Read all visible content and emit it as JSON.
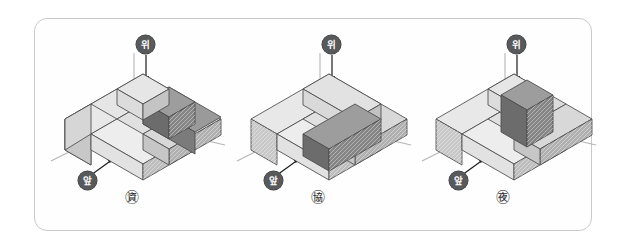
{
  "figure": {
    "kind": "geometry-diagram",
    "border_color": "#c9c9c9",
    "background": "#ffffff"
  },
  "labels": {
    "top_direction": "위",
    "front_direction": "앞",
    "badge_bg": "#58595b",
    "badge_fg": "#ffffff"
  },
  "colors": {
    "face_top_light": "#e3e3e3",
    "face_left_light": "#efefef",
    "face_right_light": "#cfcfcf",
    "face_top_mid": "#d2d2d2",
    "face_left_mid": "#c5c5c5",
    "face_right_mid": "#b4b4b4",
    "face_top_dark": "#8e8e8e",
    "face_left_dark": "#7f7f7f",
    "face_right_dark": "#6e6e6e",
    "edge": "#4a4a4a",
    "axis": "#b5b5b5"
  },
  "panels": [
    {
      "id": "panel-ga",
      "name": "㊮",
      "label": "㊮",
      "top_badge": "위",
      "front_badge": "앞",
      "dark_block": "back-right horizontal bar, 2 cubes running right-back, raised on second level"
    },
    {
      "id": "panel-na",
      "name": "㊯",
      "label": "㊯",
      "top_badge": "위",
      "front_badge": "앞",
      "dark_block": "center bar of 2 cubes running front-left, raised on second level"
    },
    {
      "id": "panel-da",
      "name": "㊰",
      "label": "㊰",
      "top_badge": "위",
      "front_badge": "앞",
      "dark_block": "center bar of 2 cubes running back-right, raised on second level"
    }
  ]
}
